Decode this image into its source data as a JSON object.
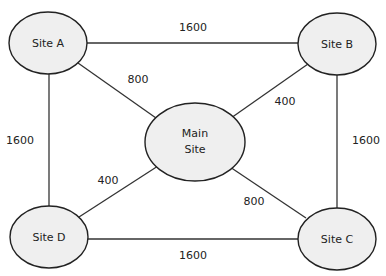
{
  "nodes": [
    {
      "id": "A",
      "label": "Site A"
    },
    {
      "id": "B",
      "label": "Site B"
    },
    {
      "id": "C",
      "label": "Site C"
    },
    {
      "id": "D",
      "label": "Site D"
    },
    {
      "id": "M",
      "label_line1": "Main",
      "label_line2": "Site"
    }
  ],
  "edges": [
    {
      "from": "Site A",
      "to": "Site B",
      "weight": "1600"
    },
    {
      "from": "Site A",
      "to": "Main Site",
      "weight": "800"
    },
    {
      "from": "Site B",
      "to": "Main Site",
      "weight": "400"
    },
    {
      "from": "Site A",
      "to": "Site D",
      "weight": "1600"
    },
    {
      "from": "Site B",
      "to": "Site C",
      "weight": "1600"
    },
    {
      "from": "Site D",
      "to": "Main Site",
      "weight": "400"
    },
    {
      "from": "Main Site",
      "to": "Site C",
      "weight": "800"
    },
    {
      "from": "Site D",
      "to": "Site C",
      "weight": "1600"
    }
  ],
  "colors": {
    "node_fill": "#efefef",
    "stroke": "#222222",
    "background": "#ffffff"
  }
}
